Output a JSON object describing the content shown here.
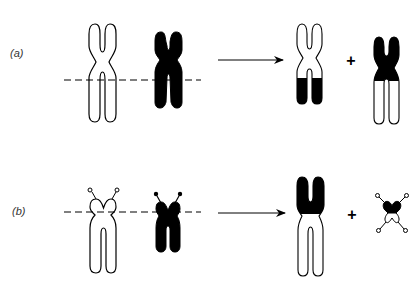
{
  "diagram": {
    "type": "chromosome-translocation",
    "colors": {
      "chromosome_a": "#ffffff",
      "chromosome_b": "#000000",
      "outline": "#000000",
      "background": "#ffffff"
    },
    "panels": [
      {
        "label": "(a)",
        "description": "Reciprocal translocation between two metacentric chromosomes; break points on dashed line",
        "inputs": [
          "white metacentric chromosome",
          "black metacentric chromosome"
        ],
        "break_line": "dashed",
        "arrow": "right",
        "outputs": [
          "white chromosome with black distal arms",
          "black chromosome with white distal arms"
        ],
        "operator": "+"
      },
      {
        "label": "(b)",
        "description": "Robertsonian translocation between two acrocentric chromosomes with satellites; break points near centromere",
        "inputs": [
          "white acrocentric chromosome with satellites",
          "black acrocentric chromosome with satellites"
        ],
        "break_line": "dashed",
        "arrow": "right",
        "outputs": [
          "large fused chromosome (black top, white long arms)",
          "small chromosome fragment with satellites"
        ],
        "operator": "+"
      }
    ]
  }
}
